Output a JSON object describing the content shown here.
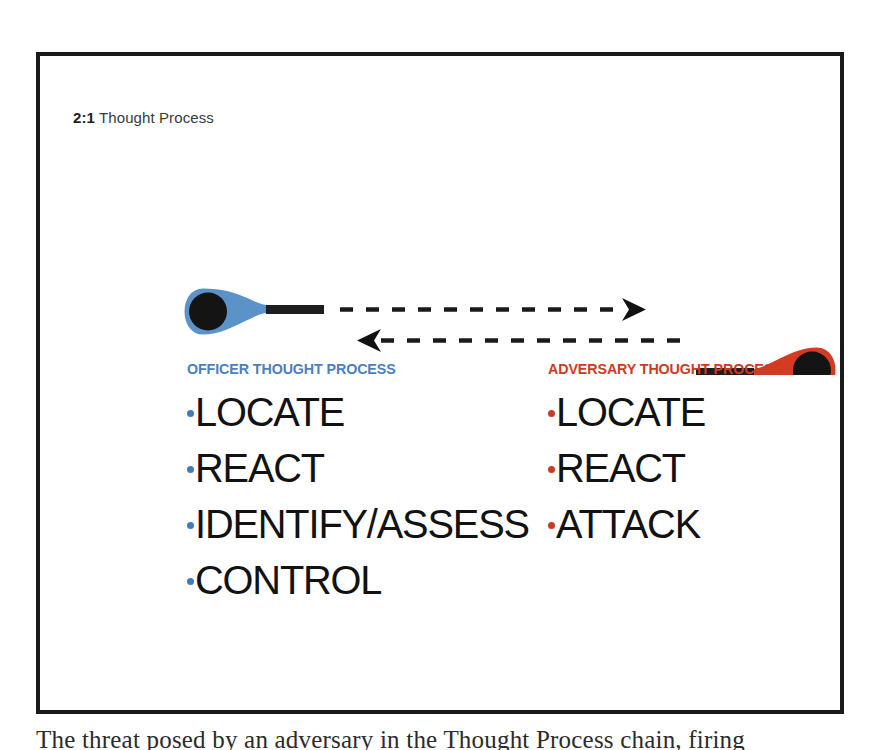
{
  "figure": {
    "slide_label": {
      "number": "2:1",
      "text": "Thought Process"
    },
    "columns": [
      {
        "id": "officer",
        "heading": "OFFICER THOUGHT PROCESS",
        "color": "#4a7fc1",
        "bullet_color": "#3f7cbe",
        "items": [
          "LOCATE",
          "REACT",
          "IDENTIFY/ASSESS",
          "CONTROL"
        ]
      },
      {
        "id": "adversary",
        "heading": "ADVERSARY THOUGHT PROCESS",
        "color": "#cf3a22",
        "bullet_color": "#cf3a22",
        "items": [
          "LOCATE",
          "REACT",
          "ATTACK"
        ]
      }
    ],
    "diagram": {
      "officer_figure_color": "#5b92c8",
      "adversary_figure_color": "#d43b22",
      "head_color": "#141414",
      "weapon_color": "#1e1e1e",
      "arrow_color": "#1a1a1a",
      "top_arrow_direction": "right",
      "bottom_arrow_direction": "left"
    },
    "border_color": "#1a1a1a"
  },
  "page": {
    "clipped_body_text": "The threat posed by an adversary in the Thought Process chain, firing"
  }
}
